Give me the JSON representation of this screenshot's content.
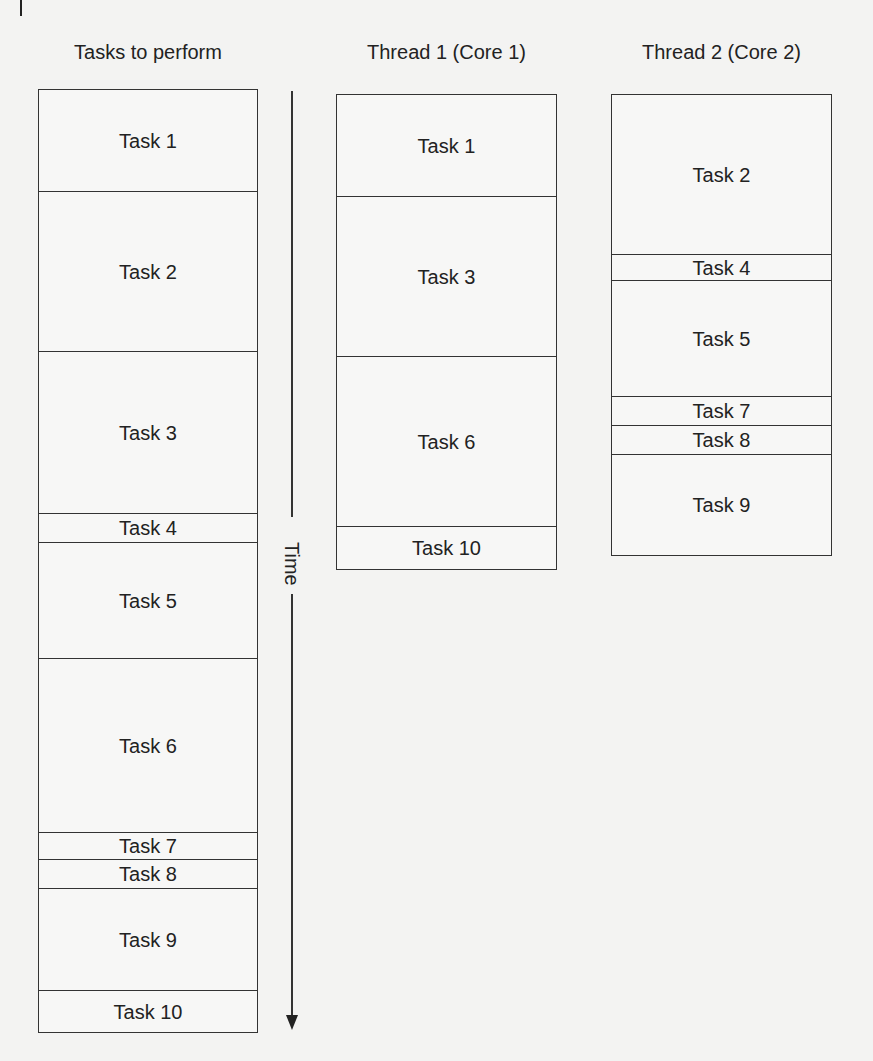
{
  "columns": [
    {
      "title": "Tasks to perform",
      "tasks": [
        {
          "label": "Task 1",
          "top": 0,
          "height": 101
        },
        {
          "label": "Task 2",
          "top": 101,
          "height": 160
        },
        {
          "label": "Task 3",
          "top": 261,
          "height": 162
        },
        {
          "label": "Task 4",
          "top": 423,
          "height": 29
        },
        {
          "label": "Task 5",
          "top": 452,
          "height": 116
        },
        {
          "label": "Task 6",
          "top": 568,
          "height": 174
        },
        {
          "label": "Task 7",
          "top": 742,
          "height": 27
        },
        {
          "label": "Task 8",
          "top": 769,
          "height": 29
        },
        {
          "label": "Task 9",
          "top": 798,
          "height": 102
        },
        {
          "label": "Task 10",
          "top": 900,
          "height": 43
        }
      ]
    },
    {
      "title": "Thread 1 (Core 1)",
      "tasks": [
        {
          "label": "Task 1",
          "top": 0,
          "height": 101
        },
        {
          "label": "Task 3",
          "top": 101,
          "height": 160
        },
        {
          "label": "Task 6",
          "top": 261,
          "height": 170
        },
        {
          "label": "Task 10",
          "top": 431,
          "height": 44
        }
      ]
    },
    {
      "title": "Thread 2 (Core 2)",
      "tasks": [
        {
          "label": "Task 2",
          "top": 0,
          "height": 159
        },
        {
          "label": "Task 4",
          "top": 159,
          "height": 26
        },
        {
          "label": "Task 5",
          "top": 185,
          "height": 116
        },
        {
          "label": "Task 7",
          "top": 301,
          "height": 29
        },
        {
          "label": "Task 8",
          "top": 330,
          "height": 29
        },
        {
          "label": "Task 9",
          "top": 359,
          "height": 102
        }
      ]
    }
  ],
  "time_axis": {
    "label": "Time",
    "direction": "down"
  },
  "colors": {
    "line": "#333333",
    "background": "#f3f3f2",
    "box_fill": "#f7f7f6"
  }
}
